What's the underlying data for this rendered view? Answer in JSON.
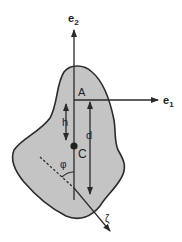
{
  "diagram": {
    "colors": {
      "body_fill": "#c4c4c4",
      "outline": "#2a2a2a",
      "background": "#ffffff"
    },
    "labels": {
      "e2": {
        "base": "e",
        "sub": "2"
      },
      "e1": {
        "base": "e",
        "sub": "1"
      },
      "A": "A",
      "C": "C",
      "h": "h",
      "d": "d",
      "phi": "φ",
      "zeta": "ζ"
    },
    "elements": {
      "body": "irregular-rigid-body",
      "axis_e2": "vertical-axis-arrow",
      "axis_e1": "horizontal-axis-arrow",
      "point_C": "center-of-mass-dot",
      "h_arrow": "double-headed-arrow",
      "d_arrow": "single-headed-arrow-down",
      "zeta_axis": "dashed-to-solid-arrow",
      "phi_arc": "angle-arc"
    }
  }
}
